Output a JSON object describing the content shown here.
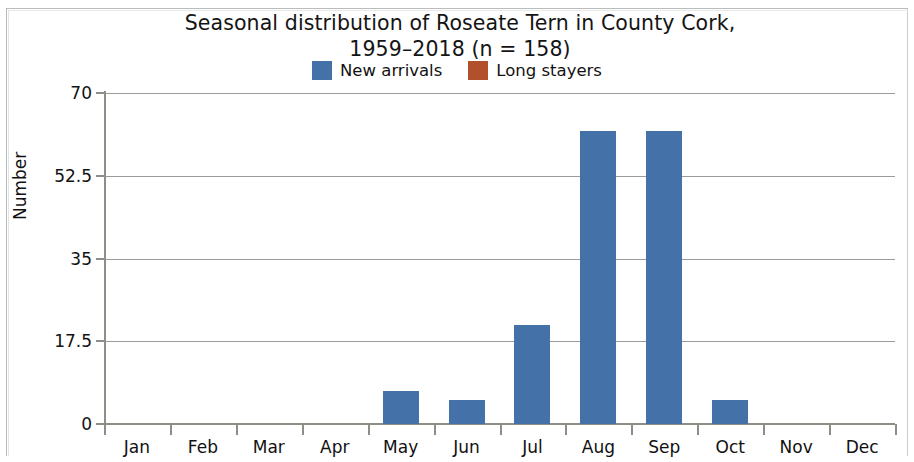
{
  "chart_data": {
    "type": "bar",
    "title": "Seasonal distribution of Roseate Tern in County Cork,\n1959–2018 (n = 158)",
    "title_line1": "Seasonal distribution of Roseate Tern in County Cork,",
    "title_line2": "1959–2018 (n = 158)",
    "xlabel": "",
    "ylabel": "Number",
    "ylim": [
      0,
      70
    ],
    "yticks": [
      "0",
      "17.5",
      "35",
      "52.5",
      "70"
    ],
    "ytick_values": [
      0,
      17.5,
      35,
      52.5,
      70
    ],
    "grid": true,
    "legend_position": "top-center",
    "categories": [
      "Jan",
      "Feb",
      "Mar",
      "Apr",
      "May",
      "Jun",
      "Jul",
      "Aug",
      "Sep",
      "Oct",
      "Nov",
      "Dec"
    ],
    "series": [
      {
        "name": "New arrivals",
        "color": "#4472a8",
        "values": [
          0,
          0,
          0,
          0,
          7,
          5,
          21,
          62,
          62,
          5,
          0,
          0
        ]
      },
      {
        "name": "Long stayers",
        "color": "#b0502d",
        "values": [
          0,
          0,
          0,
          0,
          0,
          0,
          0,
          0,
          0,
          0,
          0,
          0
        ]
      }
    ]
  },
  "legend": {
    "items": [
      {
        "label": "New arrivals",
        "color": "#4472a8"
      },
      {
        "label": "Long stayers",
        "color": "#b0502d"
      }
    ]
  },
  "colors": {
    "new_arrivals": "#4472a8",
    "long_stayers": "#b0502d",
    "axis": "#8c8f86",
    "grid": "#9a9d95",
    "text": "#121212",
    "background": "#ffffff"
  }
}
